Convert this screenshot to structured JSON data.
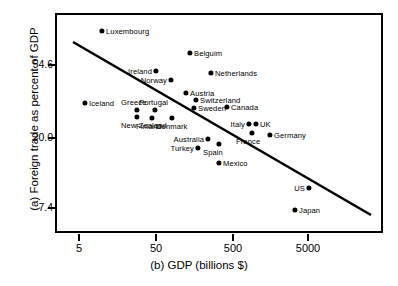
{
  "chart_data": {
    "type": "scatter",
    "title": "",
    "xlabel": "(b) GDP (billions $)",
    "ylabel": "(a) Foreign trade as percent of GDP",
    "xscale": "log",
    "yscale": "log",
    "xticks": [
      "5",
      "50",
      "500",
      "5000"
    ],
    "yticks": [
      "54.6",
      "20.0",
      "7.4"
    ],
    "grid": false,
    "legend": "none",
    "trendline": {
      "present": true,
      "x0": 73,
      "y0": 42,
      "x1": 371,
      "y1": 215
    },
    "points": [
      {
        "label": "Luxembourg",
        "x": 8,
        "y": 90,
        "px": 102,
        "py": 31,
        "side": "right"
      },
      {
        "label": "Belguim",
        "x": 230,
        "y": 62,
        "px": 190,
        "py": 53,
        "side": "right"
      },
      {
        "label": "Ireland",
        "x": 47,
        "y": 53,
        "px": 156,
        "py": 71,
        "side": "left"
      },
      {
        "label": "Netherlands",
        "x": 330,
        "y": 51,
        "px": 211,
        "py": 73,
        "side": "right"
      },
      {
        "label": "Norway",
        "x": 93,
        "y": 46,
        "px": 171,
        "py": 80,
        "side": "left"
      },
      {
        "label": "Austria",
        "x": 190,
        "y": 39,
        "px": 186,
        "py": 93,
        "side": "right"
      },
      {
        "label": "Switzerland",
        "x": 250,
        "y": 35,
        "px": 196,
        "py": 100,
        "side": "right"
      },
      {
        "label": "Iceland",
        "x": 5.4,
        "y": 34,
        "px": 85,
        "py": 103,
        "side": "right"
      },
      {
        "label": "Greece",
        "x": 38,
        "y": 31,
        "px": 137,
        "py": 110,
        "side": "above"
      },
      {
        "label": "Portugal",
        "x": 70,
        "y": 31,
        "px": 155,
        "py": 110,
        "side": "above"
      },
      {
        "label": "Sweden",
        "x": 240,
        "y": 32,
        "px": 194,
        "py": 108,
        "side": "right"
      },
      {
        "label": "Canada",
        "x": 490,
        "y": 33,
        "px": 227,
        "py": 107,
        "side": "right"
      },
      {
        "label": "New Zealand",
        "x": 38,
        "y": 29,
        "px": 137,
        "py": 117,
        "side": "below"
      },
      {
        "label": "Finland",
        "x": 62,
        "y": 29,
        "px": 152,
        "py": 118,
        "side": "below"
      },
      {
        "label": "Denmark",
        "x": 120,
        "y": 29,
        "px": 172,
        "py": 118,
        "side": "below"
      },
      {
        "label": "Italy",
        "x": 860,
        "y": 26,
        "px": 249,
        "py": 124,
        "side": "left"
      },
      {
        "label": "UK",
        "x": 1000,
        "y": 26,
        "px": 256,
        "py": 124,
        "side": "right"
      },
      {
        "label": "France",
        "x": 920,
        "y": 23,
        "px": 252,
        "py": 133,
        "side": "below"
      },
      {
        "label": "Germany",
        "x": 1600,
        "y": 22.5,
        "px": 270,
        "py": 135,
        "side": "right"
      },
      {
        "label": "Australia",
        "x": 290,
        "y": 21,
        "px": 208,
        "py": 139,
        "side": "left"
      },
      {
        "label": "Spain",
        "x": 400,
        "y": 20,
        "px": 219,
        "py": 144,
        "side": "below"
      },
      {
        "label": "Turkey",
        "x": 215,
        "y": 19,
        "px": 198,
        "py": 148,
        "side": "left"
      },
      {
        "label": "Mexico",
        "x": 400,
        "y": 15.5,
        "px": 219,
        "py": 163,
        "side": "right"
      },
      {
        "label": "US",
        "x": 5200,
        "y": 11,
        "px": 309,
        "py": 188,
        "side": "left"
      },
      {
        "label": "Japan",
        "x": 3600,
        "y": 8.2,
        "px": 295,
        "py": 210,
        "side": "right"
      }
    ]
  },
  "axes": {
    "y_tick_positions": [
      65,
      138,
      208
    ],
    "x_tick_positions": [
      79,
      156,
      233,
      308
    ]
  }
}
